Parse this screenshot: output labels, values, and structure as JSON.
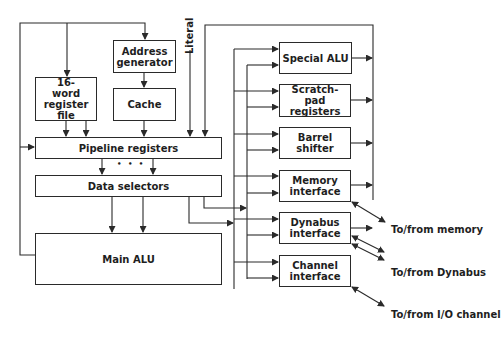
{
  "diagram": {
    "type": "block-diagram",
    "blocks": {
      "address_generator": "Address generator",
      "cache": "Cache",
      "register_file": "16-word register file",
      "pipeline_registers": "Pipeline registers",
      "data_selectors": "Data selectors",
      "main_alu": "Main ALU",
      "special_alu": "Special ALU",
      "scratch_pad": "Scratch-pad registers",
      "barrel_shifter": "Barrel shifter",
      "memory_interface": "Memory interface",
      "dynabus_interface": "Dynabus interface",
      "channel_interface": "Channel interface"
    },
    "labels": {
      "literal": "Literal",
      "ellipsis": "• • •",
      "to_from_memory": "To/from memory",
      "to_from_dynabus": "To/from Dynabus",
      "to_from_io": "To/from I/O channel"
    },
    "colors": {
      "line": "#2a2a2a",
      "background": "#ffffff"
    }
  }
}
